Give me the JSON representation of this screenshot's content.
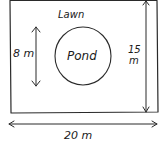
{
  "diagram": {
    "region_label": "Lawn",
    "feature_label": "Pond",
    "dimensions": {
      "width": "20 m",
      "height_value": "15",
      "height_unit": "m",
      "pond_diameter": "8 m"
    },
    "colors": {
      "line": "#2a2a2a",
      "background": "#ffffff"
    }
  }
}
